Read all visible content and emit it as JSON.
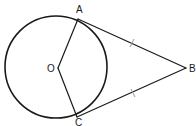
{
  "diagram": {
    "type": "geometry",
    "colors": {
      "line": "#1a1a1a",
      "tick": "#9a9a9a",
      "background": "#ffffff"
    },
    "circle": {
      "center_label": "O",
      "cx": 56,
      "cy": 67,
      "r": 51
    },
    "points": {
      "O": {
        "label": "O",
        "x": 58,
        "y": 68
      },
      "A": {
        "label": "A",
        "x": 78,
        "y": 19
      },
      "B": {
        "label": "B",
        "x": 186,
        "y": 68
      },
      "C": {
        "label": "C",
        "x": 77,
        "y": 117
      }
    },
    "segments": [
      {
        "from": "O",
        "to": "A",
        "kind": "radius"
      },
      {
        "from": "O",
        "to": "C",
        "kind": "radius"
      },
      {
        "from": "A",
        "to": "B",
        "kind": "tangent",
        "tick_marks": 1
      },
      {
        "from": "C",
        "to": "B",
        "kind": "tangent",
        "tick_marks": 1
      }
    ],
    "labels": {
      "A": "A",
      "B": "B",
      "C": "C",
      "O": "O"
    }
  }
}
